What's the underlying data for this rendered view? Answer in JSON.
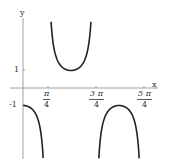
{
  "chart_data": {
    "type": "line",
    "title": "",
    "function": "y = -sec(2x)",
    "xlabel": "x",
    "ylabel": "y",
    "xlim": [
      0,
      4.2
    ],
    "ylim": [
      -3.9,
      4.2
    ],
    "grid": false,
    "x_ticks": [
      {
        "value": 0.7854,
        "num": "π",
        "den": "4"
      },
      {
        "value": 2.3562,
        "num": "3 π",
        "den": "4"
      },
      {
        "value": 3.927,
        "num": "5 π",
        "den": "4"
      }
    ],
    "y_ticks": [
      {
        "value": 1,
        "label": "1"
      },
      {
        "value": -1,
        "label": "-1"
      }
    ],
    "asymptotes": [
      0.7854,
      2.3562,
      3.927
    ],
    "series": [
      {
        "name": "branch-1",
        "x": [
          0,
          0.2,
          0.4,
          0.55,
          0.65,
          0.7
        ],
        "y": [
          -1,
          -1.09,
          -1.44,
          -2.2,
          -3.73,
          -5.88
        ]
      },
      {
        "name": "branch-2",
        "x": [
          0.9,
          1.1,
          1.3,
          1.5708,
          1.85,
          2.05,
          2.25
        ],
        "y": [
          4.4,
          1.7,
          1.15,
          1,
          1.19,
          1.8,
          4.8
        ]
      },
      {
        "name": "branch-3",
        "x": [
          2.46,
          2.7,
          2.9,
          3.1416,
          3.4,
          3.6,
          3.85
        ],
        "y": [
          -4.8,
          -1.6,
          -1.13,
          -1,
          -1.15,
          -1.65,
          -6.5
        ]
      }
    ]
  },
  "axes": {
    "x_label": "x",
    "y_label": "y"
  }
}
